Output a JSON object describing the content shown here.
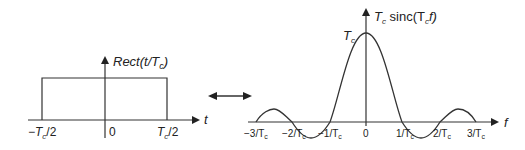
{
  "left_plot": {
    "y_label": "Rect(t/T_c)",
    "y_label_main": "Rect(t/T",
    "y_label_sub": "c",
    "y_label_end": ")",
    "x_axis_label": "t",
    "ticks": [
      {
        "main": "−T",
        "sub": "c",
        "end": "/2"
      },
      {
        "main": "0",
        "sub": "",
        "end": ""
      },
      {
        "main": "T",
        "sub": "c",
        "end": "/2"
      }
    ]
  },
  "transform_arrow": {
    "symbol": "double-headed-arrow"
  },
  "right_plot": {
    "y_label_main": "T",
    "y_label_sub": "c",
    "y_label_mid": " sinc(T",
    "y_label_sub2": "c",
    "y_label_end": "f)",
    "peak_label_main": "T",
    "peak_label_sub": "c",
    "x_axis_label": "f",
    "ticks": [
      "−3/T",
      "−2/T",
      "−1/T",
      "0",
      "1/T",
      "2/T",
      "3/T"
    ],
    "tick_sub": "c"
  }
}
